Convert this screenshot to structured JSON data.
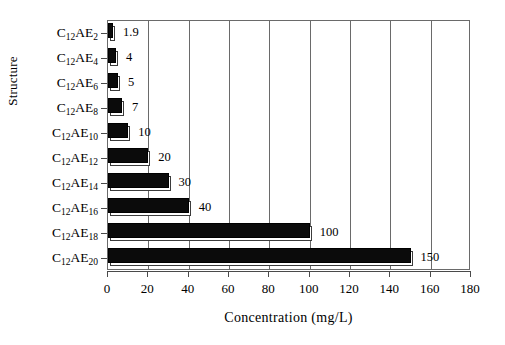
{
  "chart_data": {
    "type": "bar",
    "orientation": "horizontal",
    "title": "",
    "xlabel": "Concentration (mg/L)",
    "ylabel": "Structure",
    "categories": [
      "C12AE2",
      "C12AE4",
      "C12AE6",
      "C12AE8",
      "C12AE10",
      "C12AE12",
      "C12AE14",
      "C12AE16",
      "C12AE18",
      "C12AE20"
    ],
    "category_labels": [
      {
        "base": "C",
        "sub1": "12",
        "mid": "AE",
        "sub2": "2"
      },
      {
        "base": "C",
        "sub1": "12",
        "mid": "AE",
        "sub2": "4"
      },
      {
        "base": "C",
        "sub1": "12",
        "mid": "AE",
        "sub2": "6"
      },
      {
        "base": "C",
        "sub1": "12",
        "mid": "AE",
        "sub2": "8"
      },
      {
        "base": "C",
        "sub1": "12",
        "mid": "AE",
        "sub2": "10"
      },
      {
        "base": "C",
        "sub1": "12",
        "mid": "AE",
        "sub2": "12"
      },
      {
        "base": "C",
        "sub1": "12",
        "mid": "AE",
        "sub2": "14"
      },
      {
        "base": "C",
        "sub1": "12",
        "mid": "AE",
        "sub2": "16"
      },
      {
        "base": "C",
        "sub1": "12",
        "mid": "AE",
        "sub2": "18"
      },
      {
        "base": "C",
        "sub1": "12",
        "mid": "AE",
        "sub2": "20"
      }
    ],
    "values": [
      1.9,
      4,
      5,
      7,
      10,
      20,
      30,
      40,
      100,
      150
    ],
    "value_labels": [
      "1.9",
      "4",
      "5",
      "7",
      "10",
      "20",
      "30",
      "40",
      "100",
      "150"
    ],
    "xlim": [
      0,
      180
    ],
    "xticks": [
      0,
      20,
      40,
      60,
      80,
      100,
      120,
      140,
      160,
      180
    ],
    "xtick_labels": [
      "0",
      "20",
      "40",
      "60",
      "80",
      "100",
      "120",
      "140",
      "160",
      "180"
    ],
    "grid": "vertical",
    "legend": "none",
    "colors": {
      "bar_fill": "#0b0b0b",
      "bar_shadow_fill": "#ffffff",
      "bar_outline": "#000000",
      "frame": "#6a6a6a",
      "axis": "#4a4a4a",
      "background": "#ffffff",
      "text": "#000000"
    }
  }
}
